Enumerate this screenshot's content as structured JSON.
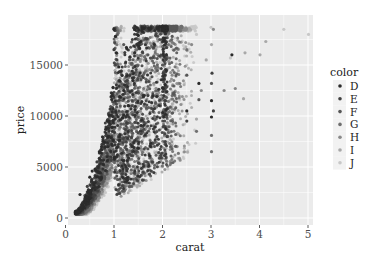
{
  "chart_data": {
    "type": "scatter",
    "title": "",
    "xlabel": "carat",
    "ylabel": "price",
    "xlim": [
      -0.05,
      5.2
    ],
    "ylim": [
      -900,
      19400
    ],
    "x_ticks": [
      0,
      1,
      2,
      3,
      4,
      5
    ],
    "x_tick_labels": [
      "0",
      "1",
      "2",
      "3",
      "4",
      "5"
    ],
    "y_ticks": [
      0,
      5000,
      10000,
      15000
    ],
    "y_tick_labels": [
      "0",
      "5000",
      "10000",
      "15000"
    ],
    "grid": true,
    "panel_background": "#ebebeb",
    "grid_color": "#ffffff",
    "legend": {
      "title": "color",
      "position": "right",
      "entries": [
        "D",
        "E",
        "F",
        "G",
        "H",
        "I",
        "J"
      ],
      "colors": [
        "#2b2b2b",
        "#404040",
        "#575757",
        "#6f6f6f",
        "#8a8a8a",
        "#a8a8a8",
        "#c8c8c8"
      ]
    },
    "series": [
      {
        "name": "D",
        "color": "#2b2b2b",
        "envelope": {
          "carat_min": 0.2,
          "carat_max": 3.45,
          "main_max": 2.1
        },
        "points": [
          [
            0.7,
            6500
          ],
          [
            0.9,
            9500
          ],
          [
            1.0,
            18500
          ],
          [
            1.03,
            17800
          ],
          [
            1.05,
            16200
          ],
          [
            1.1,
            14800
          ],
          [
            1.2,
            12500
          ],
          [
            1.3,
            11000
          ],
          [
            1.5,
            17900
          ],
          [
            2.01,
            18500
          ],
          [
            2.5,
            10500
          ],
          [
            2.75,
            13200
          ],
          [
            3.01,
            11500
          ],
          [
            3.01,
            9900
          ],
          [
            3.43,
            16000
          ],
          [
            0.3,
            2300
          ],
          [
            0.5,
            4000
          ],
          [
            0.55,
            4600
          ]
        ]
      },
      {
        "name": "E",
        "color": "#404040",
        "envelope": {
          "carat_min": 0.2,
          "carat_max": 3.05,
          "main_max": 2.1
        },
        "points": [
          [
            0.65,
            5500
          ],
          [
            0.95,
            8000
          ],
          [
            1.0,
            16500
          ],
          [
            1.06,
            15500
          ],
          [
            1.25,
            13000
          ],
          [
            1.5,
            16800
          ],
          [
            1.7,
            12000
          ],
          [
            2.0,
            17500
          ],
          [
            2.5,
            9500
          ],
          [
            3.02,
            14200
          ],
          [
            3.05,
            10500
          ],
          [
            0.45,
            3100
          ]
        ]
      },
      {
        "name": "F",
        "color": "#575757",
        "envelope": {
          "carat_min": 0.2,
          "carat_max": 3.05,
          "main_max": 2.3
        },
        "points": [
          [
            0.7,
            4800
          ],
          [
            1.0,
            12000
          ],
          [
            1.2,
            17000
          ],
          [
            1.51,
            18500
          ],
          [
            1.7,
            16000
          ],
          [
            2.0,
            15000
          ],
          [
            2.2,
            17800
          ],
          [
            2.5,
            14000
          ],
          [
            2.75,
            11600
          ],
          [
            3.01,
            13200
          ],
          [
            0.4,
            2200
          ]
        ]
      },
      {
        "name": "G",
        "color": "#6f6f6f",
        "envelope": {
          "carat_min": 0.23,
          "carat_max": 3.05,
          "main_max": 2.4
        },
        "points": [
          [
            0.7,
            3600
          ],
          [
            1.0,
            10500
          ],
          [
            1.5,
            17500
          ],
          [
            1.8,
            18500
          ],
          [
            2.0,
            16800
          ],
          [
            2.2,
            12000
          ],
          [
            2.5,
            16500
          ],
          [
            2.7,
            8500
          ],
          [
            3.01,
            8100
          ],
          [
            3.01,
            6500
          ],
          [
            0.35,
            1500
          ]
        ]
      },
      {
        "name": "H",
        "color": "#8a8a8a",
        "envelope": {
          "carat_min": 0.23,
          "carat_max": 3.55,
          "main_max": 2.5
        },
        "points": [
          [
            0.7,
            3000
          ],
          [
            1.0,
            8500
          ],
          [
            1.5,
            15000
          ],
          [
            1.6,
            4500
          ],
          [
            2.0,
            18500
          ],
          [
            2.2,
            14000
          ],
          [
            2.3,
            7000
          ],
          [
            2.6,
            17000
          ],
          [
            2.8,
            12500
          ],
          [
            3.05,
            18500
          ],
          [
            3.27,
            12500
          ],
          [
            3.5,
            12700
          ]
        ]
      },
      {
        "name": "I",
        "color": "#a8a8a8",
        "envelope": {
          "carat_min": 0.23,
          "carat_max": 4.15,
          "main_max": 2.6
        },
        "points": [
          [
            0.7,
            2500
          ],
          [
            1.0,
            6000
          ],
          [
            1.5,
            11000
          ],
          [
            2.0,
            5100
          ],
          [
            2.1,
            9000
          ],
          [
            2.4,
            18500
          ],
          [
            2.7,
            9700
          ],
          [
            2.9,
            15500
          ],
          [
            3.01,
            17000
          ],
          [
            3.67,
            11700
          ],
          [
            3.7,
            16200
          ],
          [
            4.01,
            16000
          ],
          [
            4.13,
            17300
          ]
        ]
      },
      {
        "name": "J",
        "color": "#c8c8c8",
        "envelope": {
          "carat_min": 0.23,
          "carat_max": 5.01,
          "main_max": 2.7
        },
        "points": [
          [
            0.7,
            2300
          ],
          [
            1.0,
            4500
          ],
          [
            1.5,
            8000
          ],
          [
            2.0,
            5000
          ],
          [
            2.2,
            6700
          ],
          [
            2.5,
            15000
          ],
          [
            2.7,
            18000
          ],
          [
            3.0,
            18700
          ],
          [
            3.4,
            15700
          ],
          [
            4.5,
            18500
          ],
          [
            5.01,
            18000
          ]
        ]
      }
    ],
    "shape_notes": {
      "price_cap": 18823,
      "min_carat": 0.2,
      "min_price": 326,
      "vertical_bands_at_carat": [
        1.0,
        1.5,
        2.0,
        3.0
      ]
    }
  }
}
